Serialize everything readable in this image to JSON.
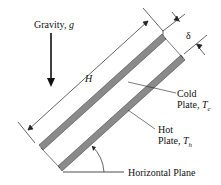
{
  "diagram": {
    "gravity_label": "Gravity, ",
    "gravity_symbol": "g",
    "height_label": "H",
    "gap_label": "δ",
    "cold_plate_line1": "Cold",
    "cold_plate_line2": "Plate, ",
    "cold_plate_symbol": "T",
    "cold_plate_sub": "c",
    "hot_plate_line1": "Hot",
    "hot_plate_line2": "Plate, ",
    "hot_plate_symbol": "T",
    "hot_plate_sub": "h",
    "horizontal_plane_label": "Horizontal Plane",
    "colors": {
      "plate_fill": "#8a8a8a",
      "plate_edge": "#444444",
      "line": "#222222"
    }
  }
}
